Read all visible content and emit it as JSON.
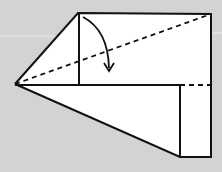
{
  "diagram": {
    "type": "origami-fold-step",
    "background_color": "#d3d3d3",
    "paper_color": "#ffffff",
    "line_color": "#111111",
    "shapes": {
      "left_point": [
        15,
        84
      ],
      "upper_flap_top_left": [
        78,
        13
      ],
      "upper_flap_top_right": [
        211,
        14
      ],
      "crease_corner": [
        79,
        85
      ],
      "lower_rect_top_left": [
        180,
        85
      ],
      "lower_rect_bottom_left": [
        180,
        157
      ],
      "lower_rect_bottom_right": [
        211,
        157
      ]
    },
    "fold_lines": [
      {
        "name": "valley-fold-diagonal",
        "from": [
          15,
          84
        ],
        "to": [
          211,
          14
        ],
        "style": "dashed"
      },
      {
        "name": "valley-fold-horizontal",
        "from": [
          180,
          85
        ],
        "to": [
          211,
          85
        ],
        "style": "dashed"
      }
    ],
    "arrow": {
      "name": "fold-down-arrow",
      "direction": "down",
      "meaning": "fold flap down"
    }
  }
}
